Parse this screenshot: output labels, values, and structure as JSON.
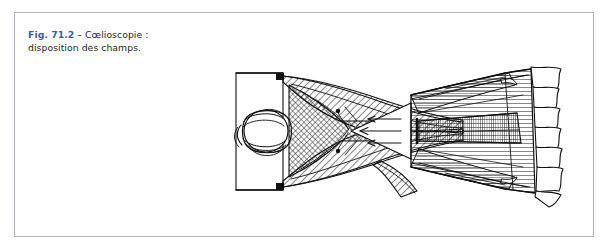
{
  "page": {
    "background_color": "#ffffff",
    "panel_border_color": "#a9b6c9"
  },
  "figure": {
    "label": "Fig. 71.2",
    "dash": " – ",
    "caption_text": "Cœlioscopie : disposition des champs.",
    "label_color": "#3d5da6",
    "text_color": "#262626"
  },
  "illustration": {
    "name": "coelioscopie-field-layout-line-drawing",
    "description": "Dessin au trait : patiente installée, tête à gauche, champs opératoires disposés, fenêtre opératoire triangulaire centrale avec flèches",
    "ink_color": "#111111"
  }
}
